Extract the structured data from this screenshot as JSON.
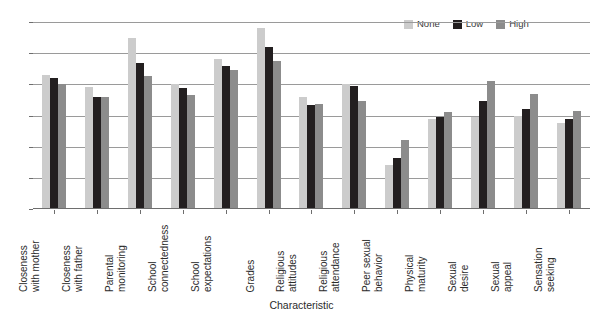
{
  "chart_data": {
    "type": "bar",
    "title": "",
    "xlabel": "Characteristic",
    "ylabel": "",
    "ylim": [
      0,
      6
    ],
    "yticks": [
      0,
      1,
      2,
      3,
      4,
      5,
      6
    ],
    "grid": true,
    "legend_position": "top-right",
    "categories": [
      "Closeness with mother",
      "Closeness with father",
      "Parental monitoring",
      "School connectedness",
      "School expectations",
      "Grades",
      "Religious attitudes",
      "Religious attendance",
      "Peer sexual behavior",
      "Physical maturity",
      "Sexual desire",
      "Sexual appeal",
      "Sensation seeking"
    ],
    "category_lines": [
      [
        "Closeness",
        "with mother"
      ],
      [
        "Closeness",
        "with father"
      ],
      [
        "Parental",
        "monitoring"
      ],
      [
        "School",
        "connectedness"
      ],
      [
        "School",
        "expectations"
      ],
      [
        "Grades"
      ],
      [
        "Religious",
        "attitudes"
      ],
      [
        "Religious",
        "attendance"
      ],
      [
        "Peer sexual",
        "behavior"
      ],
      [
        "Physical",
        "maturity"
      ],
      [
        "Sexual",
        "desire"
      ],
      [
        "Sexual",
        "appeal"
      ],
      [
        "Sensation",
        "seeking"
      ]
    ],
    "series": [
      {
        "name": "None",
        "color": "#cccccc",
        "values": [
          4.3,
          3.9,
          5.5,
          4.0,
          4.8,
          5.8,
          3.6,
          4.0,
          1.4,
          2.9,
          2.95,
          3.0,
          2.75
        ]
      },
      {
        "name": "Low",
        "color": "#231f20",
        "values": [
          4.2,
          3.6,
          4.7,
          3.87,
          4.6,
          5.2,
          3.35,
          3.95,
          1.65,
          2.95,
          3.45,
          3.2,
          2.9
        ]
      },
      {
        "name": "High",
        "color": "#8c8c8c",
        "values": [
          4.0,
          3.58,
          4.28,
          3.65,
          4.45,
          4.75,
          3.38,
          3.47,
          2.2,
          3.1,
          4.1,
          3.68,
          3.15
        ]
      }
    ]
  },
  "legend": {
    "items": [
      {
        "label": "None",
        "color": "#cccccc"
      },
      {
        "label": "Low",
        "color": "#231f20"
      },
      {
        "label": "High",
        "color": "#8c8c8c"
      }
    ]
  },
  "axes": {
    "x_title": "Characteristic"
  }
}
